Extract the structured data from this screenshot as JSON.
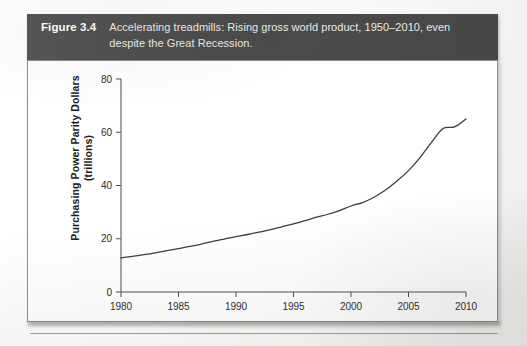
{
  "figure": {
    "number_label": "Figure 3.4",
    "caption_line1": "Accelerating treadmills: Rising gross world product, 1950–2010, even",
    "caption_line2": "despite the Great Recession.",
    "caption_full": "Accelerating treadmills: Rising gross world product, 1950–2010, even despite the Great Recession.",
    "bar_color": "#4e4e4e",
    "bar_text_color": "#f2f2f0"
  },
  "chart_data": {
    "type": "line",
    "title": "",
    "subtitle": "",
    "xlabel": "",
    "ylabel_line1": "Purchasing Power Parity Dollars",
    "ylabel_line2": "(trillions)",
    "ylabel": "Purchasing Power Parity Dollars (trillions)",
    "xlim": [
      1980,
      2010
    ],
    "ylim": [
      0,
      80
    ],
    "xticks": [
      1980,
      1985,
      1990,
      1995,
      2000,
      2005,
      2010
    ],
    "xticklabels": [
      "1980",
      "1985",
      "1990",
      "1995",
      "2000",
      "2005",
      "2010"
    ],
    "yticks": [
      0,
      20,
      40,
      60,
      80
    ],
    "yticklabels": [
      "0",
      "20",
      "40",
      "60",
      "80"
    ],
    "grid": false,
    "legend": false,
    "line_color": "#3c3c3c",
    "line_width": 1.3,
    "series": [
      {
        "name": "Gross world product",
        "x": [
          1980,
          1981,
          1982,
          1983,
          1984,
          1985,
          1986,
          1987,
          1988,
          1989,
          1990,
          1991,
          1992,
          1993,
          1994,
          1995,
          1996,
          1997,
          1998,
          1999,
          2000,
          2001,
          2002,
          2003,
          2004,
          2005,
          2006,
          2007,
          2008,
          2009,
          2010
        ],
        "values": [
          12.8,
          13.4,
          14.0,
          14.7,
          15.5,
          16.3,
          17.1,
          18.0,
          19.0,
          19.9,
          20.8,
          21.6,
          22.5,
          23.4,
          24.5,
          25.6,
          26.8,
          28.1,
          29.2,
          30.6,
          32.3,
          33.6,
          35.6,
          38.3,
          41.7,
          45.6,
          50.5,
          56.2,
          61.4,
          62.0,
          65.0
        ]
      }
    ],
    "annotations": []
  }
}
